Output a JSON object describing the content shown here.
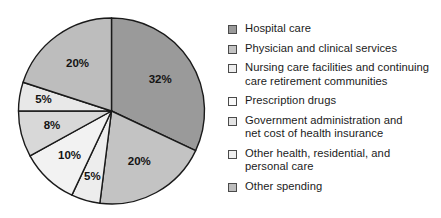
{
  "chart_data": {
    "type": "pie",
    "title": "",
    "subtitle": "",
    "xlabel": "",
    "ylabel": "",
    "legend_position": "right",
    "grid": false,
    "start_angle_deg": 0,
    "direction": "clockwise",
    "units": "percent",
    "categories": [
      "Hospital care",
      "Physician and clinical services",
      "Nursing care facilities and continuing care retirement communities",
      "Prescription drugs",
      "Government administration and net cost of health insurance",
      "Other health, residential, and personal care",
      "Other spending"
    ],
    "values": [
      32,
      20,
      5,
      10,
      8,
      5,
      20
    ],
    "data_labels": [
      "32%",
      "20%",
      "5%",
      "10%",
      "8%",
      "5%",
      "20%"
    ],
    "colors": [
      "#9a9a9a",
      "#c3c3c3",
      "#ededed",
      "#f2f2f2",
      "#d8d8d8",
      "#e8e8e8",
      "#bdbdbd"
    ],
    "slice_stroke": "#1a1a1a"
  },
  "legend": {
    "items": [
      {
        "label": "Hospital care",
        "color": "#9a9a9a"
      },
      {
        "label": "Physician and clinical services",
        "color": "#c3c3c3"
      },
      {
        "label": "Nursing care facilities and continuing\ncare retirement communities",
        "color": "#ededed"
      },
      {
        "label": "Prescription drugs",
        "color": "#f8f8f8"
      },
      {
        "label": "Government administration and\nnet cost of health insurance",
        "color": "#e4e4e4"
      },
      {
        "label": "Other health, residential, and\npersonal care",
        "color": "#eeeeee"
      },
      {
        "label": "Other spending",
        "color": "#bdbdbd"
      }
    ]
  }
}
